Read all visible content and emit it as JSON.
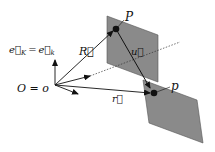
{
  "diagram": {
    "labels": {
      "basis": "e⃗",
      "basis_K": "K",
      "eq1": "=",
      "basis2": "e⃗",
      "basis_k": "k",
      "origin": "O = o",
      "R": "R⃗",
      "u": "u⃗",
      "r": "r⃗",
      "P": "P",
      "p": "p"
    },
    "colors": {
      "plane": "#8a8a8a",
      "line": "#111111"
    }
  }
}
